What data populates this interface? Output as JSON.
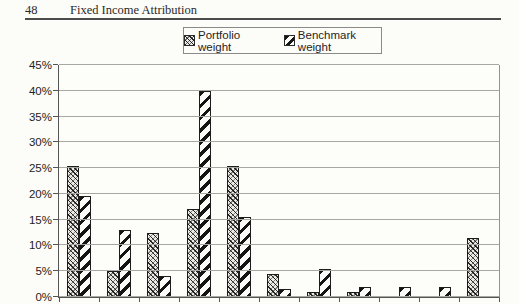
{
  "page": {
    "page_number": "48",
    "running_title": "Fixed Income Attribution"
  },
  "legend": {
    "items": [
      {
        "label": "Portfolio weight",
        "swatch_icon": "crosshatch-pattern-icon"
      },
      {
        "label": "Benchmark weight",
        "swatch_icon": "diagonal-stripe-pattern-icon"
      }
    ]
  },
  "chart_data": {
    "type": "bar",
    "title": "",
    "xlabel": "",
    "ylabel": "",
    "ylim": [
      0,
      45
    ],
    "y_tick_step": 5,
    "y_tick_labels": [
      "0%",
      "5%",
      "10%",
      "15%",
      "20%",
      "25%",
      "30%",
      "35%",
      "40%",
      "45%"
    ],
    "grid": "horizontal",
    "legend_position": "top-center",
    "x_axis_labels_visible": false,
    "series": [
      {
        "name": "Portfolio weight",
        "values": [
          25.5,
          5,
          12.5,
          17,
          25.5,
          4.5,
          1,
          1,
          0,
          0,
          11.5
        ]
      },
      {
        "name": "Benchmark weight",
        "values": [
          19.5,
          13,
          4,
          40,
          15.5,
          1.5,
          5.5,
          2,
          2,
          2,
          0
        ]
      }
    ],
    "colors": {
      "bar_outline": "#1c1c1c",
      "gridline": "#a8a8a2",
      "axis": "#555555",
      "paper": "#fcfcf9"
    }
  }
}
